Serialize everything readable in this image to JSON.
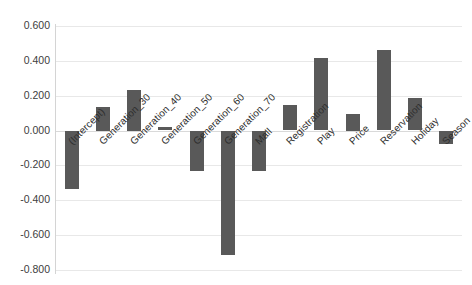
{
  "chart_data": {
    "type": "bar",
    "title": "",
    "subtitle": "",
    "xlabel": "",
    "ylabel": "",
    "ylim": [
      -0.8,
      0.6
    ],
    "ytick_step": 0.2,
    "grid": true,
    "legend": "none",
    "bar_color": "#595959",
    "gridline_color": "#e8e8e8",
    "yticks": [
      "0.600",
      "0.400",
      "0.200",
      "0.000",
      "-0.200",
      "-0.400",
      "-0.600",
      "-0.800"
    ],
    "ytick_values": [
      0.6,
      0.4,
      0.2,
      0.0,
      -0.2,
      -0.4,
      -0.6,
      -0.8
    ],
    "categories": [
      "(Intercept)",
      "Generation_30",
      "Generation_40",
      "Generation_50",
      "Generation_60",
      "Generation_70",
      "Mall",
      "Registration",
      "Play",
      "Price",
      "Reservation",
      "Holiday",
      "Season"
    ],
    "values": [
      -0.33,
      0.135,
      0.235,
      0.02,
      -0.23,
      -0.71,
      -0.23,
      0.145,
      0.415,
      0.095,
      0.46,
      0.185,
      -0.075
    ]
  }
}
